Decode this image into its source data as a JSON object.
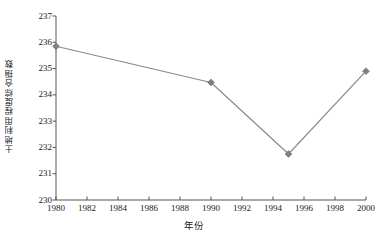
{
  "chart_data": {
    "type": "line",
    "title": "",
    "xlabel": "年份",
    "ylabel": "土地利用程度综合指数",
    "x": [
      1980,
      1990,
      1995,
      2000
    ],
    "values": [
      235.85,
      234.47,
      231.75,
      234.9
    ],
    "series": [
      {
        "name": "土地利用程度综合指数",
        "x": [
          1980,
          1990,
          1995,
          2000
        ],
        "values": [
          235.85,
          234.47,
          231.75,
          234.9
        ]
      }
    ],
    "xlim": [
      1980,
      2000
    ],
    "ylim": [
      230,
      237
    ],
    "xticks": [
      1980,
      1982,
      1984,
      1986,
      1988,
      1990,
      1992,
      1994,
      1996,
      1998,
      2000
    ],
    "xtick_labels": [
      "1980",
      "1982",
      "1984",
      "1986",
      "1988",
      "1990",
      "1992",
      "1994",
      "1996",
      "1998",
      "2000"
    ],
    "yticks": [
      230,
      231,
      232,
      233,
      234,
      235,
      236,
      237
    ],
    "ytick_labels": [
      "230",
      "231",
      "232",
      "233",
      "234",
      "235",
      "236",
      "237"
    ],
    "grid": false,
    "legend": false,
    "marker": "diamond",
    "line_color": "#8a8a8a",
    "marker_color": "#808080",
    "axis_color": "#555555"
  },
  "caption": {
    "text": ""
  }
}
